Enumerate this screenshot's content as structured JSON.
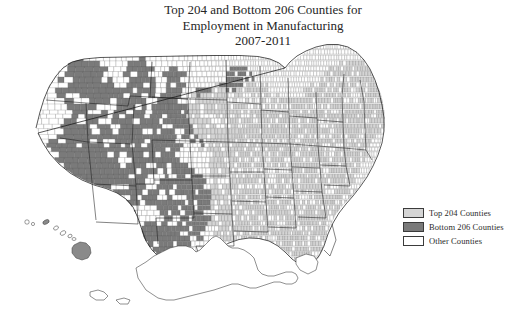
{
  "figure": {
    "width": 518,
    "height": 314,
    "background": "#ffffff"
  },
  "title": {
    "lines": [
      "Top 204 and Bottom 206 Counties for",
      "Employment in Manufacturing",
      "2007-2011"
    ],
    "line1": "Top 204 and Bottom 206 Counties for",
    "line2": "Employment in Manufacturing",
    "line3": "2007-2011"
  },
  "map": {
    "type": "choropleth",
    "geography": "United States counties",
    "includes_insets": [
      "Alaska",
      "Hawaii"
    ],
    "county_border_color": "#5a5a5a",
    "state_border_color": "#1c1c1c"
  },
  "legend": {
    "items": [
      {
        "label": "Top 204 Counties",
        "color": "#d5d5d5",
        "swatch": "light-gray-swatch"
      },
      {
        "label": "Bottom 206 Counties",
        "color": "#7a7a7a",
        "swatch": "dark-gray-swatch"
      },
      {
        "label": "Other Counties",
        "color": "#ffffff",
        "swatch": "white-swatch"
      }
    ]
  },
  "chart_data": {
    "type": "map",
    "title": "Top 204 and Bottom 206 Counties for Employment in Manufacturing 2007-2011",
    "categories": [
      "Top 204 Counties",
      "Bottom 206 Counties",
      "Other Counties"
    ],
    "values": [
      204,
      206,
      2733
    ],
    "colors": [
      "#d5d5d5",
      "#7a7a7a",
      "#ffffff"
    ],
    "legend_position": "right"
  }
}
